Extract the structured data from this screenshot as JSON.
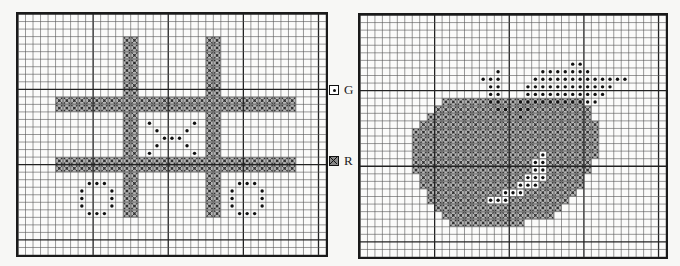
{
  "legend": [
    {
      "symbol": "dot",
      "label": "G"
    },
    {
      "symbol": "cross",
      "label": "R"
    }
  ],
  "right_labels": [
    "G",
    "R"
  ],
  "grid": {
    "cols": 41,
    "rows": 32,
    "major_every": 10
  },
  "charts": [
    {
      "name": "tic-tac-toe",
      "cross_rects": [
        {
          "c0": 14,
          "c1": 15,
          "r0": 3,
          "r1": 26
        },
        {
          "c0": 25,
          "c1": 26,
          "r0": 3,
          "r1": 26
        },
        {
          "c0": 5,
          "c1": 36,
          "r0": 11,
          "r1": 12
        },
        {
          "c0": 5,
          "c1": 36,
          "r0": 19,
          "r1": 20
        }
      ],
      "dots": [
        [
          17,
          14
        ],
        [
          23,
          14
        ],
        [
          18,
          15
        ],
        [
          22,
          15
        ],
        [
          19,
          16
        ],
        [
          20,
          16
        ],
        [
          21,
          16
        ],
        [
          18,
          17
        ],
        [
          22,
          17
        ],
        [
          17,
          18
        ],
        [
          23,
          18
        ],
        [
          9,
          22
        ],
        [
          10,
          22
        ],
        [
          11,
          22
        ],
        [
          8,
          23
        ],
        [
          12,
          23
        ],
        [
          8,
          24
        ],
        [
          12,
          24
        ],
        [
          8,
          25
        ],
        [
          12,
          25
        ],
        [
          9,
          26
        ],
        [
          10,
          26
        ],
        [
          11,
          26
        ],
        [
          29,
          22
        ],
        [
          30,
          22
        ],
        [
          31,
          22
        ],
        [
          28,
          23
        ],
        [
          32,
          23
        ],
        [
          28,
          24
        ],
        [
          32,
          24
        ],
        [
          28,
          25
        ],
        [
          32,
          25
        ],
        [
          29,
          26
        ],
        [
          30,
          26
        ],
        [
          31,
          26
        ]
      ]
    },
    {
      "name": "apple",
      "cross_rows": [
        {
          "r": 11,
          "c0": 11,
          "c1": 29
        },
        {
          "r": 12,
          "c0": 10,
          "c1": 30
        },
        {
          "r": 13,
          "c0": 9,
          "c1": 30
        },
        {
          "r": 14,
          "c0": 8,
          "c1": 31
        },
        {
          "r": 15,
          "c0": 7,
          "c1": 31
        },
        {
          "r": 16,
          "c0": 7,
          "c1": 31
        },
        {
          "r": 17,
          "c0": 7,
          "c1": 31
        },
        {
          "r": 18,
          "c0": 7,
          "c1": 31
        },
        {
          "r": 19,
          "c0": 7,
          "c1": 30
        },
        {
          "r": 20,
          "c0": 7,
          "c1": 30
        },
        {
          "r": 21,
          "c0": 8,
          "c1": 29
        },
        {
          "r": 22,
          "c0": 8,
          "c1": 29
        },
        {
          "r": 23,
          "c0": 9,
          "c1": 28
        },
        {
          "r": 24,
          "c0": 9,
          "c1": 27
        },
        {
          "r": 25,
          "c0": 10,
          "c1": 26
        },
        {
          "r": 26,
          "c0": 11,
          "c1": 25
        },
        {
          "r": 27,
          "c0": 12,
          "c1": 21
        }
      ],
      "dots": [
        [
          28,
          6
        ],
        [
          29,
          6
        ],
        [
          18,
          7
        ],
        [
          24,
          7
        ],
        [
          25,
          7
        ],
        [
          26,
          7
        ],
        [
          27,
          7
        ],
        [
          28,
          7
        ],
        [
          29,
          7
        ],
        [
          30,
          7
        ],
        [
          16,
          8
        ],
        [
          17,
          8
        ],
        [
          18,
          8
        ],
        [
          23,
          8
        ],
        [
          24,
          8
        ],
        [
          25,
          8
        ],
        [
          26,
          8
        ],
        [
          27,
          8
        ],
        [
          28,
          8
        ],
        [
          29,
          8
        ],
        [
          30,
          8
        ],
        [
          31,
          8
        ],
        [
          32,
          8
        ],
        [
          33,
          8
        ],
        [
          34,
          8
        ],
        [
          35,
          8
        ],
        [
          17,
          9
        ],
        [
          18,
          9
        ],
        [
          22,
          9
        ],
        [
          23,
          9
        ],
        [
          24,
          9
        ],
        [
          25,
          9
        ],
        [
          26,
          9
        ],
        [
          27,
          9
        ],
        [
          28,
          9
        ],
        [
          29,
          9
        ],
        [
          30,
          9
        ],
        [
          31,
          9
        ],
        [
          32,
          9
        ],
        [
          33,
          9
        ],
        [
          17,
          10
        ],
        [
          18,
          10
        ],
        [
          22,
          10
        ],
        [
          23,
          10
        ],
        [
          24,
          10
        ],
        [
          25,
          10
        ],
        [
          26,
          10
        ],
        [
          27,
          10
        ],
        [
          28,
          10
        ],
        [
          29,
          10
        ],
        [
          30,
          10
        ],
        [
          31,
          10
        ],
        [
          32,
          10
        ],
        [
          17,
          11
        ],
        [
          18,
          11
        ],
        [
          21,
          11
        ],
        [
          22,
          11
        ],
        [
          23,
          11
        ],
        [
          24,
          11
        ],
        [
          25,
          11
        ],
        [
          26,
          11
        ],
        [
          27,
          11
        ],
        [
          28,
          11
        ],
        [
          29,
          11
        ],
        [
          30,
          11
        ],
        [
          31,
          11
        ],
        [
          18,
          12
        ],
        [
          19,
          12
        ],
        [
          21,
          12
        ],
        [
          22,
          12
        ],
        [
          21,
          13
        ],
        [
          24,
          18
        ],
        [
          23,
          19
        ],
        [
          24,
          19
        ],
        [
          23,
          20
        ],
        [
          24,
          20
        ],
        [
          22,
          21
        ],
        [
          23,
          21
        ],
        [
          24,
          21
        ],
        [
          21,
          22
        ],
        [
          22,
          22
        ],
        [
          23,
          22
        ],
        [
          19,
          23
        ],
        [
          20,
          23
        ],
        [
          21,
          23
        ],
        [
          17,
          24
        ],
        [
          18,
          24
        ],
        [
          19,
          24
        ]
      ],
      "white_dots": [
        [
          24,
          18
        ],
        [
          23,
          19
        ],
        [
          24,
          19
        ],
        [
          23,
          20
        ],
        [
          24,
          20
        ],
        [
          22,
          21
        ],
        [
          23,
          21
        ],
        [
          24,
          21
        ],
        [
          21,
          22
        ],
        [
          22,
          22
        ],
        [
          23,
          22
        ],
        [
          19,
          23
        ],
        [
          20,
          23
        ],
        [
          21,
          23
        ],
        [
          17,
          24
        ],
        [
          18,
          24
        ],
        [
          19,
          24
        ]
      ]
    }
  ]
}
